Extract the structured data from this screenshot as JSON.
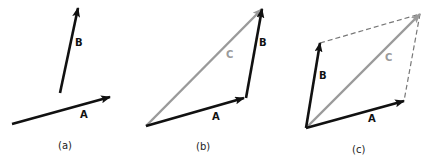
{
  "figure": {
    "panels": [
      {
        "caption": "(a)",
        "vectors": [
          {
            "label": "A",
            "color": "#111111",
            "from": [
              12,
              124
            ],
            "to": [
              110,
              97
            ],
            "label_pos": [
              80,
              118
            ]
          },
          {
            "label": "B",
            "color": "#111111",
            "from": [
              60,
              93
            ],
            "to": [
              78,
              8
            ],
            "label_pos": [
              75,
              46
            ]
          }
        ]
      },
      {
        "caption": "(b)",
        "vectors": [
          {
            "label": "A",
            "color": "#111111",
            "from": [
              146,
              126
            ],
            "to": [
              244,
              98
            ],
            "label_pos": [
              212,
              120
            ]
          },
          {
            "label": "B",
            "color": "#111111",
            "from": [
              246,
              98
            ],
            "to": [
              262,
              9
            ],
            "label_pos": [
              259,
              46
            ]
          },
          {
            "label": "C",
            "color": "#9a9a9a",
            "from": [
              146,
              126
            ],
            "to": [
              262,
              9
            ],
            "label_pos": [
              226,
              58
            ]
          }
        ]
      },
      {
        "caption": "(c)",
        "vectors": [
          {
            "label": "A",
            "color": "#111111",
            "from": [
              306,
              128
            ],
            "to": [
              404,
              101
            ],
            "label_pos": [
              368,
              122
            ]
          },
          {
            "label": "B",
            "color": "#111111",
            "from": [
              306,
              128
            ],
            "to": [
              320,
              43
            ],
            "label_pos": [
              319,
              79
            ]
          },
          {
            "label": "C",
            "color": "#9a9a9a",
            "from": [
              306,
              128
            ],
            "to": [
              420,
              14
            ],
            "label_pos": [
              385,
              61
            ]
          }
        ],
        "dashed_lines": [
          {
            "from": [
              320,
              43
            ],
            "to": [
              420,
              14
            ],
            "color": "#777777"
          },
          {
            "from": [
              420,
              14
            ],
            "to": [
              404,
              101
            ],
            "color": "#777777"
          }
        ]
      }
    ],
    "labels": {
      "a_A": "A",
      "a_B": "B",
      "b_A": "A",
      "b_B": "B",
      "b_C": "C",
      "c_A": "A",
      "c_B": "B",
      "c_C": "C",
      "cap_a": "(a)",
      "cap_b": "(b)",
      "cap_c": "(c)"
    }
  }
}
